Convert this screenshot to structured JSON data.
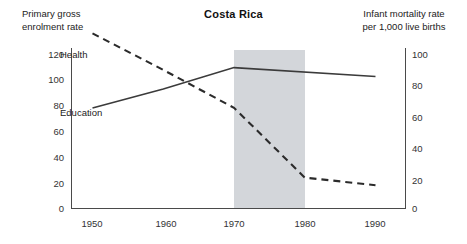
{
  "chart_data": {
    "type": "line",
    "title": "Costa Rica",
    "xlabel": "",
    "ylabel": "Primary gross enrolment rate",
    "y2label": "Infant mortality rate per 1,000 live births",
    "grid": false,
    "legend": "inline-series-labels",
    "x": [
      1950,
      1960,
      1970,
      1980,
      1990
    ],
    "xlim": [
      1945,
      1992
    ],
    "ylim": [
      0,
      120
    ],
    "y2lim": [
      0,
      100
    ],
    "yticks": [
      0,
      20,
      40,
      60,
      80,
      100,
      120
    ],
    "y2ticks": [
      0,
      20,
      40,
      60,
      80,
      100
    ],
    "xticks": [
      1950,
      1960,
      1970,
      1980,
      1990
    ],
    "highlight_band": {
      "label": "1970-1980",
      "start": 1970,
      "end": 1980,
      "color": "#d3d6da"
    },
    "series": [
      {
        "name": "Education",
        "axis": "left",
        "style": "solid",
        "color": "#3b3b3b",
        "x": [
          1950,
          1960,
          1970,
          1990
        ],
        "values": [
          79,
          94,
          111,
          104
        ]
      },
      {
        "name": "Health",
        "axis": "right",
        "style": "dashed",
        "color": "#2b2b2b",
        "x": [
          1950,
          1960,
          1970,
          1980,
          1990
        ],
        "values": [
          115,
          91,
          66,
          20,
          15
        ]
      }
    ]
  },
  "captions": {
    "left": "Primary gross\nenrolment rate",
    "right": "Infant mortality rate\nper 1,000 live births"
  },
  "title": "Costa Rica",
  "series_labels": {
    "health": "Health",
    "education": "Education"
  },
  "left_ticks": {
    "t120": "120",
    "t100": "100",
    "t80": "80",
    "t60": "60",
    "t40": "40",
    "t20": "20",
    "t0": "0"
  },
  "right_ticks": {
    "t100": "100",
    "t80": "80",
    "t60": "60",
    "t40": "40",
    "t20": "20",
    "t0": "0"
  },
  "x_ticks": {
    "t1950": "1950",
    "t1960": "1960",
    "t1970": "1970",
    "t1980": "1980",
    "t1990": "1990"
  }
}
